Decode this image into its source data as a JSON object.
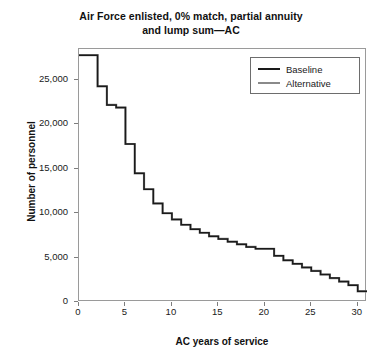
{
  "chart_data": {
    "type": "line",
    "title": "Air Force enlisted, 0% match, partial annuity and lump sum—AC",
    "title_line1": "Air Force enlisted, 0% match, partial annuity",
    "title_line2": "and lump sum—AC",
    "xlabel": "AC years of service",
    "ylabel": "Number of personnel",
    "xlim": [
      0,
      31
    ],
    "ylim": [
      0,
      28500
    ],
    "xticks": [
      0,
      5,
      10,
      15,
      20,
      25,
      30
    ],
    "xtick_labels": [
      "0",
      "5",
      "10",
      "15",
      "20",
      "25",
      "30"
    ],
    "yticks": [
      0,
      5000,
      10000,
      15000,
      20000,
      25000
    ],
    "ytick_labels": [
      "0",
      "5,000",
      "10,000",
      "15,000",
      "20,000",
      "25,000"
    ],
    "grid": false,
    "drawstyle": "steps-post",
    "legend_position": "top-right",
    "x": [
      0,
      1,
      2,
      3,
      4,
      5,
      6,
      7,
      8,
      9,
      10,
      11,
      12,
      13,
      14,
      15,
      16,
      17,
      18,
      19,
      20,
      21,
      22,
      23,
      24,
      25,
      26,
      27,
      28,
      29,
      30
    ],
    "series": [
      {
        "name": "Baseline",
        "color": "#1a1a1a",
        "values": [
          27800,
          27800,
          24300,
          22200,
          21900,
          17800,
          14500,
          12700,
          11100,
          10000,
          9300,
          8700,
          8200,
          7800,
          7400,
          7100,
          6800,
          6500,
          6200,
          6000,
          6000,
          5200,
          4700,
          4300,
          3900,
          3500,
          3100,
          2700,
          2300,
          1900,
          1200
        ]
      },
      {
        "name": "Alternative",
        "color": "#8a8a8a",
        "values": [
          27800,
          27800,
          24300,
          22200,
          21900,
          17800,
          14500,
          12700,
          11100,
          10000,
          9300,
          8700,
          8200,
          7800,
          7400,
          7100,
          6800,
          6500,
          6200,
          6000,
          6000,
          5200,
          4700,
          4300,
          3900,
          3500,
          3100,
          2700,
          2300,
          1900,
          1200
        ]
      }
    ],
    "legend": [
      {
        "label": "Baseline",
        "color": "#1a1a1a"
      },
      {
        "label": "Alternative",
        "color": "#8a8a8a"
      }
    ]
  }
}
